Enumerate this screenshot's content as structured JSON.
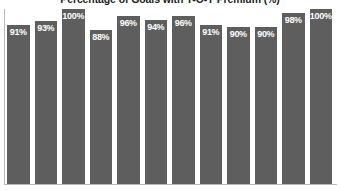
{
  "chart_data": {
    "type": "bar",
    "title": "Percentage of Goals with Y-O-Y Premium (%)",
    "xlabel": "",
    "ylabel": "",
    "ylim": [
      0,
      100
    ],
    "grid": false,
    "legend": null,
    "categories": [
      "1",
      "2",
      "3",
      "4",
      "5",
      "6",
      "7",
      "8",
      "9",
      "10",
      "11",
      "12"
    ],
    "values": [
      91,
      93,
      100,
      88,
      96,
      94,
      96,
      91,
      90,
      90,
      98,
      100
    ],
    "data_labels": [
      "91%",
      "93%",
      "100%",
      "88%",
      "96%",
      "94%",
      "96%",
      "91%",
      "90%",
      "90%",
      "98%",
      "100%"
    ],
    "bar_color": "#5e5e5e",
    "label_color": "#ffffff",
    "axis_color": "#b9b9b9"
  }
}
